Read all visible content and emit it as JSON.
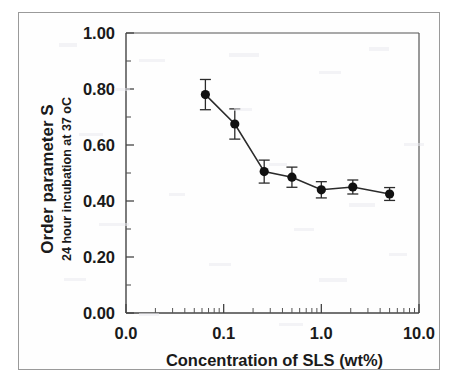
{
  "chart_data": {
    "type": "line",
    "title": "",
    "xlabel": "Concentration of SLS (wt%)",
    "ylabel_main": "Order parameter S",
    "ylabel_sub": "24 hour incubation at 37 oC",
    "xscale": "log",
    "yscale": "linear",
    "xlim": [
      0.01,
      10.0
    ],
    "ylim": [
      0.0,
      1.0
    ],
    "grid": false,
    "legend": "none",
    "marker": "filled-circle",
    "error_bars": "symmetric-vertical",
    "line_color": "#2b2b2b",
    "marker_color": "#111111",
    "axis_color": "#555555",
    "x_tick_labels": [
      "0.0",
      "0.1",
      "1.0",
      "10.0"
    ],
    "x_tick_values": [
      0.01,
      0.1,
      1.0,
      10.0
    ],
    "y_tick_labels": [
      "0.00",
      "0.20",
      "0.40",
      "0.60",
      "0.80",
      "1.00"
    ],
    "y_tick_values": [
      0.0,
      0.2,
      0.4,
      0.6,
      0.8,
      1.0
    ],
    "y_minor_tick_values": [
      0.1,
      0.3,
      0.5,
      0.7,
      0.9
    ],
    "x": [
      0.065,
      0.13,
      0.26,
      0.5,
      1.0,
      2.1,
      5.0
    ],
    "values": [
      0.78,
      0.675,
      0.505,
      0.485,
      0.44,
      0.45,
      0.425
    ],
    "yerr": [
      0.054,
      0.054,
      0.041,
      0.036,
      0.029,
      0.025,
      0.023
    ],
    "series": [
      {
        "name": "Order parameter S",
        "x": [
          0.065,
          0.13,
          0.26,
          0.5,
          1.0,
          2.1,
          5.0
        ],
        "values": [
          0.78,
          0.675,
          0.505,
          0.485,
          0.44,
          0.45,
          0.425
        ],
        "yerr": [
          0.054,
          0.054,
          0.041,
          0.036,
          0.029,
          0.025,
          0.023
        ]
      }
    ]
  }
}
